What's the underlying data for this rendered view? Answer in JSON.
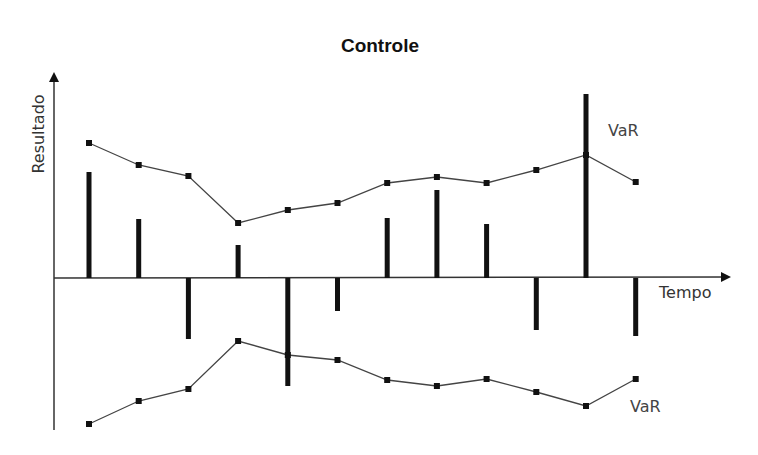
{
  "chart_data": {
    "type": "bar+line",
    "title": "Controle",
    "xlabel": "Tempo",
    "ylabel": "Resultado",
    "grid": false,
    "legend": null,
    "axis_ticks": "none (schematic, unlabeled axes)",
    "x": [
      1,
      2,
      3,
      4,
      5,
      6,
      7,
      8,
      9,
      10,
      11,
      12
    ],
    "series": [
      {
        "name": "Resultado",
        "kind": "bar",
        "values": [
          10.6,
          5.9,
          -6.1,
          3.3,
          -10.8,
          -3.3,
          6.0,
          8.8,
          5.4,
          -5.2,
          18.4,
          -5.8
        ]
      },
      {
        "name": "VaR (upper)",
        "kind": "line-markers",
        "label": "VaR",
        "values": [
          13.5,
          11.3,
          10.2,
          5.5,
          6.8,
          7.5,
          9.5,
          10.1,
          9.5,
          10.8,
          12.3,
          9.6
        ]
      },
      {
        "name": "VaR (lower)",
        "kind": "line-markers",
        "label": "VaR",
        "values": [
          -14.6,
          -12.3,
          -11.1,
          -6.3,
          -7.7,
          -8.2,
          -10.2,
          -10.8,
          -10.1,
          -11.4,
          -12.8,
          -10.1
        ]
      }
    ],
    "annotations": [
      {
        "text": "VaR",
        "near": "upper line, right of point 11"
      },
      {
        "text": "VaR",
        "near": "lower line, below-right of point 12"
      }
    ]
  },
  "labels": {
    "title": "Controle",
    "ylabel": "Resultado",
    "xlabel": "Tempo",
    "var_upper": "VaR",
    "var_lower": "VaR"
  },
  "colors": {
    "bars": "#111111",
    "lines": "#444444",
    "markers": "#111111",
    "axes": "#333333"
  }
}
